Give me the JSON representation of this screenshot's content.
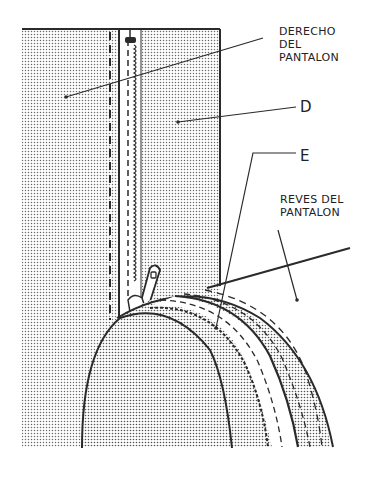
{
  "diagram": {
    "type": "technical-illustration",
    "labels": {
      "derecho": "DERECHO\nDEL\nPANTALON",
      "d": "D",
      "e": "E",
      "reves": "REVES DEL\nPANTALON"
    },
    "colors": {
      "line": "#2a2a2a",
      "dots": "#6a6a6a",
      "background": "#ffffff"
    }
  }
}
